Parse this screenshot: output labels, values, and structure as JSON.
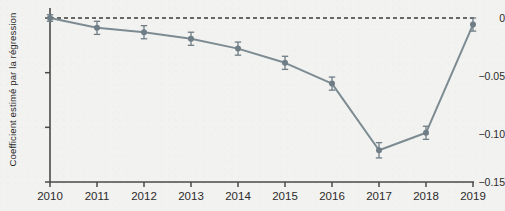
{
  "chart_data": {
    "type": "line",
    "title": "",
    "subtitle": "",
    "xlabel": "",
    "ylabel": "Coefficient estimé par la régression",
    "categories": [
      "2010",
      "2011",
      "2012",
      "2013",
      "2014",
      "2015",
      "2016",
      "2017",
      "2018",
      "2019"
    ],
    "x": [
      2010,
      2011,
      2012,
      2013,
      2014,
      2015,
      2016,
      2017,
      2018,
      2019
    ],
    "values": [
      0.0,
      -0.009,
      -0.013,
      -0.019,
      -0.028,
      -0.041,
      -0.06,
      -0.121,
      -0.105,
      -0.006
    ],
    "errors": [
      0.003,
      0.006,
      0.006,
      0.006,
      0.006,
      0.006,
      0.006,
      0.007,
      0.006,
      0.006
    ],
    "series": [
      {
        "name": "Coefficient estimé",
        "values": [
          0.0,
          -0.009,
          -0.013,
          -0.019,
          -0.028,
          -0.041,
          -0.06,
          -0.121,
          -0.105,
          -0.006
        ],
        "errors": [
          0.003,
          0.006,
          0.006,
          0.006,
          0.006,
          0.006,
          0.006,
          0.007,
          0.006,
          0.006
        ]
      }
    ],
    "ylim": [
      -0.15,
      0.005
    ],
    "xlim": [
      2010,
      2019
    ],
    "yticks": [
      0,
      -0.05,
      -0.1,
      -0.15
    ],
    "ytick_labels": [
      "0",
      "−0.05",
      "−0.10",
      "−0.15"
    ],
    "xticks": [
      2010,
      2011,
      2012,
      2013,
      2014,
      2015,
      2016,
      2017,
      2018,
      2019
    ],
    "xtick_labels": [
      "2010",
      "2011",
      "2012",
      "2013",
      "2014",
      "2015",
      "2016",
      "2017",
      "2018",
      "2019"
    ],
    "grid": false,
    "legend": null,
    "legend_position": "none",
    "reference_line": {
      "y": 0,
      "style": "dashed",
      "color": "#3a3a3a"
    },
    "annotations": [],
    "colors": {
      "line": "#7d8b93",
      "marker": "#6f7d86",
      "error_bar": "#6f7d86",
      "axis": "#4a4a4a",
      "text": "#2b2b2b",
      "background": "#f2f2f0"
    }
  }
}
